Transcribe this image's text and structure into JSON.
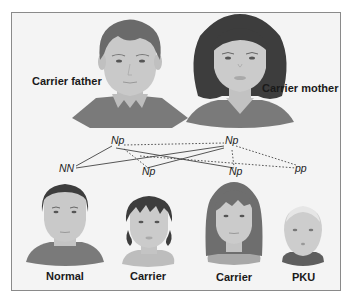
{
  "parents": {
    "father": {
      "label": "Carrier father",
      "genotype": "Np"
    },
    "mother": {
      "label": "Carrier mother",
      "genotype": "Np"
    }
  },
  "offspring": [
    {
      "label": "Normal",
      "genotype": "NN"
    },
    {
      "label": "Carrier",
      "genotype": "Np"
    },
    {
      "label": "Carrier",
      "genotype": "Np"
    },
    {
      "label": "PKU",
      "genotype": "pp"
    }
  ],
  "legend": {
    "solid_line": "dominant allele N inheritance",
    "dotted_line": "recessive allele p inheritance"
  },
  "colors": {
    "background": "#f4f4f4",
    "border": "#8a8a8a",
    "skin": "#c9c9c9",
    "hair_dark": "#3f3f3f",
    "hair_mid": "#6e6e6e",
    "clothing": "#7a7a7a",
    "line": "#444444"
  }
}
